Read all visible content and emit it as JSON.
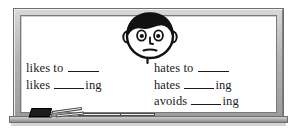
{
  "scene": {
    "title": "classroom-board-illustration",
    "board_surface_color": "#ffffff",
    "frame_color": "#b4b4b4",
    "ink_color": "#1a1a1a"
  },
  "character": {
    "name": "cartoon-boy-face",
    "expression": "frowning",
    "hair_color": "#111111",
    "skin_color": "#ffffff"
  },
  "chalk_tray": {
    "eraser_label": "eraser",
    "chalk_count": 4
  },
  "board": {
    "columns": [
      {
        "name": "likes-column",
        "lines": [
          {
            "prefix": "likes to",
            "blank": true,
            "suffix": ""
          },
          {
            "prefix": "likes",
            "blank": true,
            "suffix": "ing"
          }
        ]
      },
      {
        "name": "hates-column",
        "lines": [
          {
            "prefix": "hates to",
            "blank": true,
            "suffix": ""
          },
          {
            "prefix": "hates",
            "blank": true,
            "suffix": "ing"
          },
          {
            "prefix": "avoids",
            "blank": true,
            "suffix": "ing"
          }
        ]
      }
    ],
    "lines_flat": {
      "l1_prefix": "likes to",
      "l1_suffix": "",
      "l2_prefix": "likes",
      "l2_suffix": "ing",
      "r1_prefix": "hates to",
      "r1_suffix": "",
      "r2_prefix": "hates",
      "r2_suffix": "ing",
      "r3_prefix": "avoids",
      "r3_suffix": "ing"
    }
  }
}
